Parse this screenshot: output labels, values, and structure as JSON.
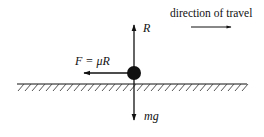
{
  "diagram": {
    "colors": {
      "ink": "#111111",
      "background": "#ffffff"
    },
    "labels": {
      "direction": "direction of travel",
      "reaction": "R",
      "friction": "F = μR",
      "weight": "mg"
    },
    "forces": [
      {
        "name": "normal-reaction",
        "label": "R",
        "direction": "up"
      },
      {
        "name": "friction",
        "label": "F = μR",
        "direction": "left"
      },
      {
        "name": "weight",
        "label": "mg",
        "direction": "down"
      }
    ],
    "motion": {
      "label": "direction of travel",
      "direction": "right"
    }
  }
}
